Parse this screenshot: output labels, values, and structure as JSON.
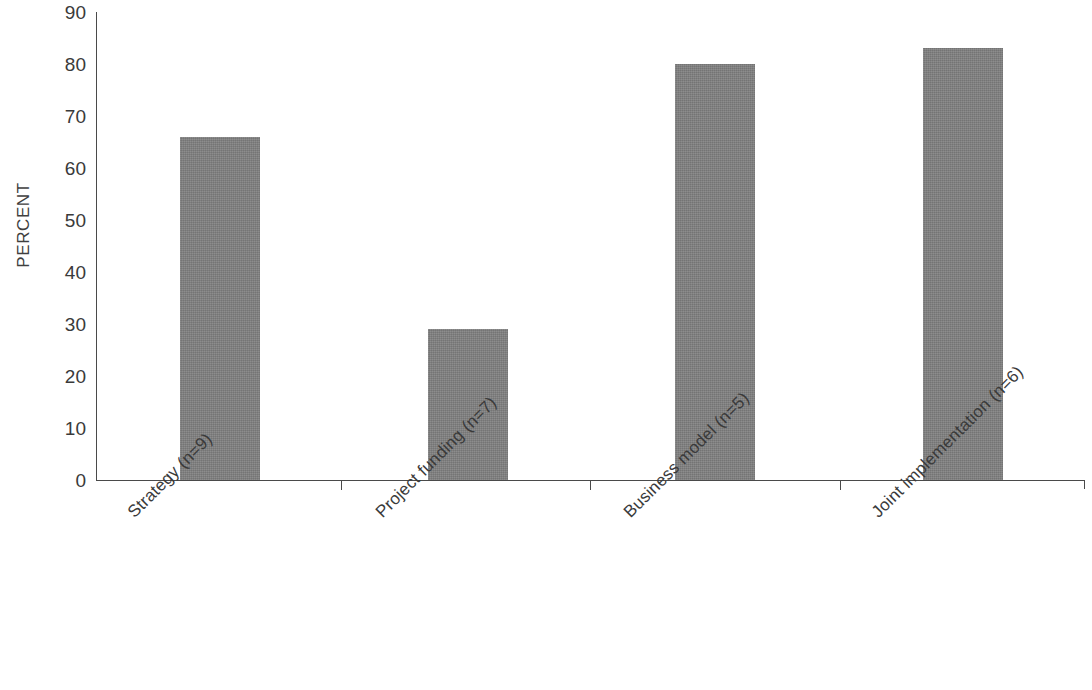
{
  "chart_data": {
    "type": "bar",
    "title": "",
    "subtitle": "",
    "xlabel": "",
    "ylabel": "PERCENT",
    "ylim": [
      0,
      90
    ],
    "yticks": [
      0,
      10,
      20,
      30,
      40,
      50,
      60,
      70,
      80,
      90
    ],
    "ytick_labels": [
      "0",
      "10",
      "20",
      "30",
      "40",
      "50",
      "60",
      "70",
      "80",
      "90"
    ],
    "grid": false,
    "legend": false,
    "legend_position": "none",
    "bar_color": "#808080",
    "axis_color": "#4a4a4a",
    "text_color": "#3a3a3a",
    "background_color": "#ffffff",
    "categories": [
      "Strategy (n=9)",
      "Project funding (n=7)",
      "Business model (n=5)",
      "Joint implementation (n=6)"
    ],
    "values": [
      66,
      29,
      80,
      83
    ],
    "bars": [
      {
        "label": "Strategy (n=9)",
        "value": 66,
        "n": 9
      },
      {
        "label": "Project funding (n=7)",
        "value": 29,
        "n": 7
      },
      {
        "label": "Business model (n=5)",
        "value": 80,
        "n": 5
      },
      {
        "label": "Joint implementation (n=6)",
        "value": 83,
        "n": 6
      }
    ]
  }
}
